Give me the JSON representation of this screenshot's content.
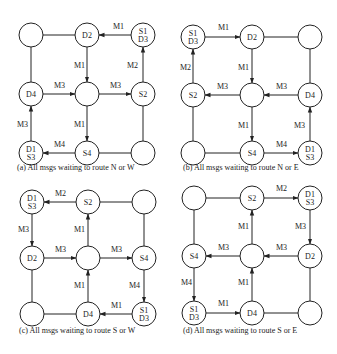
{
  "colors": {
    "stroke": "#222222",
    "background": "#ffffff"
  },
  "node_radius": 12,
  "panels": [
    {
      "id": "a",
      "caption": "(a) All msgs waiting to route N or W",
      "caption_pos": [
        17,
        170
      ],
      "xs": [
        31,
        87,
        143
      ],
      "ys": [
        35,
        94,
        153
      ],
      "nodes": [
        [
          "",
          "D2",
          "S1|D3"
        ],
        [
          "D4",
          "",
          "S2"
        ],
        [
          "D1|S3",
          "S4",
          ""
        ]
      ],
      "links": [
        {
          "from": [
            0,
            0
          ],
          "to": [
            0,
            1
          ]
        },
        {
          "from": [
            0,
            0
          ],
          "to": [
            1,
            0
          ]
        },
        {
          "from": [
            1,
            2
          ],
          "to": [
            2,
            2
          ]
        },
        {
          "from": [
            2,
            1
          ],
          "to": [
            2,
            2
          ]
        }
      ],
      "arrows": [
        {
          "from": [
            0,
            2
          ],
          "to": [
            0,
            1
          ],
          "label": "M1",
          "lpos": [
            113,
            29
          ]
        },
        {
          "from": [
            0,
            1
          ],
          "to": [
            1,
            1
          ],
          "label": "M1",
          "lpos": [
            74,
            68
          ]
        },
        {
          "from": [
            1,
            0
          ],
          "to": [
            1,
            1
          ],
          "label": "M3",
          "lpos": [
            54,
            88
          ]
        },
        {
          "from": [
            1,
            1
          ],
          "to": [
            1,
            2
          ],
          "label": "M3",
          "lpos": [
            110,
            88
          ]
        },
        {
          "from": [
            1,
            2
          ],
          "to": [
            0,
            2
          ],
          "label": "M2",
          "lpos": [
            127,
            68
          ]
        },
        {
          "from": [
            1,
            1
          ],
          "to": [
            2,
            1
          ],
          "label": "M1",
          "lpos": [
            74,
            127
          ]
        },
        {
          "from": [
            2,
            0
          ],
          "to": [
            1,
            0
          ],
          "label": "M3",
          "lpos": [
            17,
            127
          ]
        },
        {
          "from": [
            2,
            1
          ],
          "to": [
            2,
            0
          ],
          "label": "M4",
          "lpos": [
            54,
            147
          ]
        }
      ]
    },
    {
      "id": "b",
      "caption": "(b) All msgs waiting to route N or E",
      "caption_pos": [
        183,
        170
      ],
      "xs": [
        193,
        252,
        310
      ],
      "ys": [
        37,
        95,
        153
      ],
      "nodes": [
        [
          "S1|D3",
          "D2",
          ""
        ],
        [
          "S2",
          "",
          "D4"
        ],
        [
          "",
          "S4",
          "D1|S3"
        ]
      ],
      "links": [
        {
          "from": [
            0,
            1
          ],
          "to": [
            0,
            2
          ]
        },
        {
          "from": [
            0,
            2
          ],
          "to": [
            1,
            2
          ]
        },
        {
          "from": [
            1,
            0
          ],
          "to": [
            2,
            0
          ]
        },
        {
          "from": [
            2,
            0
          ],
          "to": [
            2,
            1
          ]
        }
      ],
      "arrows": [
        {
          "from": [
            0,
            0
          ],
          "to": [
            0,
            1
          ],
          "label": "M1",
          "lpos": [
            218,
            30
          ]
        },
        {
          "from": [
            0,
            1
          ],
          "to": [
            1,
            1
          ],
          "label": "M1",
          "lpos": [
            238,
            70
          ]
        },
        {
          "from": [
            1,
            0
          ],
          "to": [
            0,
            0
          ],
          "label": "M2",
          "lpos": [
            180,
            70
          ]
        },
        {
          "from": [
            1,
            1
          ],
          "to": [
            1,
            0
          ],
          "label": "M3",
          "lpos": [
            217,
            89
          ]
        },
        {
          "from": [
            1,
            2
          ],
          "to": [
            1,
            1
          ],
          "label": "M3",
          "lpos": [
            276,
            89
          ]
        },
        {
          "from": [
            1,
            1
          ],
          "to": [
            2,
            1
          ],
          "label": "M1",
          "lpos": [
            238,
            128
          ]
        },
        {
          "from": [
            2,
            1
          ],
          "to": [
            2,
            2
          ],
          "label": "M4",
          "lpos": [
            276,
            147
          ]
        },
        {
          "from": [
            2,
            2
          ],
          "to": [
            1,
            2
          ],
          "label": "M3",
          "lpos": [
            294,
            128
          ]
        }
      ]
    },
    {
      "id": "c",
      "caption": "(c) All msgs waiting to route S or W",
      "caption_pos": [
        19,
        333
      ],
      "xs": [
        32,
        88,
        144
      ],
      "ys": [
        202,
        258,
        314
      ],
      "nodes": [
        [
          "D1|S3",
          "S2",
          ""
        ],
        [
          "D2",
          "",
          "S4"
        ],
        [
          "",
          "D4",
          "S1|D3"
        ]
      ],
      "links": [
        {
          "from": [
            0,
            1
          ],
          "to": [
            0,
            2
          ]
        },
        {
          "from": [
            0,
            2
          ],
          "to": [
            1,
            2
          ]
        },
        {
          "from": [
            1,
            0
          ],
          "to": [
            2,
            0
          ]
        },
        {
          "from": [
            2,
            0
          ],
          "to": [
            2,
            1
          ]
        }
      ],
      "arrows": [
        {
          "from": [
            0,
            1
          ],
          "to": [
            0,
            0
          ],
          "label": "M2",
          "lpos": [
            55,
            196
          ]
        },
        {
          "from": [
            0,
            0
          ],
          "to": [
            1,
            0
          ],
          "label": "M3",
          "lpos": [
            18,
            232
          ]
        },
        {
          "from": [
            1,
            1
          ],
          "to": [
            0,
            1
          ],
          "label": "M1",
          "lpos": [
            74,
            232
          ]
        },
        {
          "from": [
            1,
            0
          ],
          "to": [
            1,
            1
          ],
          "label": "M3",
          "lpos": [
            55,
            252
          ]
        },
        {
          "from": [
            1,
            1
          ],
          "to": [
            1,
            2
          ],
          "label": "M3",
          "lpos": [
            111,
            252
          ]
        },
        {
          "from": [
            2,
            1
          ],
          "to": [
            1,
            1
          ],
          "label": "M1",
          "lpos": [
            74,
            288
          ]
        },
        {
          "from": [
            1,
            2
          ],
          "to": [
            2,
            2
          ],
          "label": "M4",
          "lpos": [
            129,
            288
          ]
        },
        {
          "from": [
            2,
            2
          ],
          "to": [
            2,
            1
          ],
          "label": "M1",
          "lpos": [
            111,
            308
          ]
        }
      ]
    },
    {
      "id": "d",
      "caption": "(d) All msgs waiting to route S or E",
      "caption_pos": [
        183,
        333
      ],
      "xs": [
        194,
        252,
        310
      ],
      "ys": [
        198,
        256,
        313
      ],
      "nodes": [
        [
          "",
          "S2",
          "D1|S3"
        ],
        [
          "S4",
          "",
          "D2"
        ],
        [
          "S1|D3",
          "D4",
          ""
        ]
      ],
      "links": [
        {
          "from": [
            0,
            0
          ],
          "to": [
            0,
            1
          ]
        },
        {
          "from": [
            0,
            0
          ],
          "to": [
            1,
            0
          ]
        },
        {
          "from": [
            1,
            2
          ],
          "to": [
            2,
            2
          ]
        },
        {
          "from": [
            2,
            1
          ],
          "to": [
            2,
            2
          ]
        }
      ],
      "arrows": [
        {
          "from": [
            0,
            1
          ],
          "to": [
            0,
            2
          ],
          "label": "M2",
          "lpos": [
            276,
            191
          ]
        },
        {
          "from": [
            0,
            2
          ],
          "to": [
            1,
            2
          ],
          "label": "M3",
          "lpos": [
            295,
            229
          ]
        },
        {
          "from": [
            1,
            1
          ],
          "to": [
            0,
            1
          ],
          "label": "M1",
          "lpos": [
            238,
            229
          ]
        },
        {
          "from": [
            1,
            1
          ],
          "to": [
            1,
            0
          ],
          "label": "M3",
          "lpos": [
            218,
            250
          ]
        },
        {
          "from": [
            1,
            2
          ],
          "to": [
            1,
            1
          ],
          "label": "M3",
          "lpos": [
            276,
            250
          ]
        },
        {
          "from": [
            2,
            1
          ],
          "to": [
            1,
            1
          ],
          "label": "M1",
          "lpos": [
            238,
            285
          ]
        },
        {
          "from": [
            1,
            0
          ],
          "to": [
            2,
            0
          ],
          "label": "M4",
          "lpos": [
            181,
            285
          ]
        },
        {
          "from": [
            2,
            0
          ],
          "to": [
            2,
            1
          ],
          "label": "M1",
          "lpos": [
            218,
            306
          ]
        }
      ]
    }
  ]
}
